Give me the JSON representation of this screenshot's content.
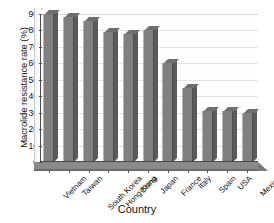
{
  "chart_data": {
    "type": "bar",
    "title": "",
    "xlabel": "Country",
    "ylabel": "Macrolide resistance rate (%)",
    "categories": [
      "Vietnam",
      "Taiwan",
      "South Korea",
      "Hong Kong",
      "China",
      "Japan",
      "France",
      "Italy",
      "Spain",
      "USA",
      "Mexico"
    ],
    "values": [
      90,
      88,
      86,
      79,
      78,
      80,
      60,
      45,
      31,
      31,
      30
    ],
    "ylim": [
      0,
      90
    ],
    "ytick_values": [
      0,
      10,
      20,
      30,
      40,
      50,
      60,
      70,
      80,
      90
    ],
    "ytick_labels": [
      "0",
      "10",
      "20",
      "30",
      "40",
      "50",
      "60",
      "70",
      "80",
      "90"
    ],
    "grid": true,
    "legend": false,
    "series": [
      {
        "name": "Macrolide resistance rate",
        "values": [
          90,
          88,
          86,
          79,
          78,
          80,
          60,
          45,
          31,
          31,
          30
        ],
        "color": "#808080"
      }
    ],
    "style": "3d-column",
    "bar_color": "#808080",
    "bar_side_color": "#5a5a5a",
    "bar_top_color": "#6e6e6e",
    "gridline_color": "#e3e3e3",
    "axis_color": "#4a4a4a",
    "floor_color": "#8a8a8a",
    "background": "#ffffff"
  }
}
